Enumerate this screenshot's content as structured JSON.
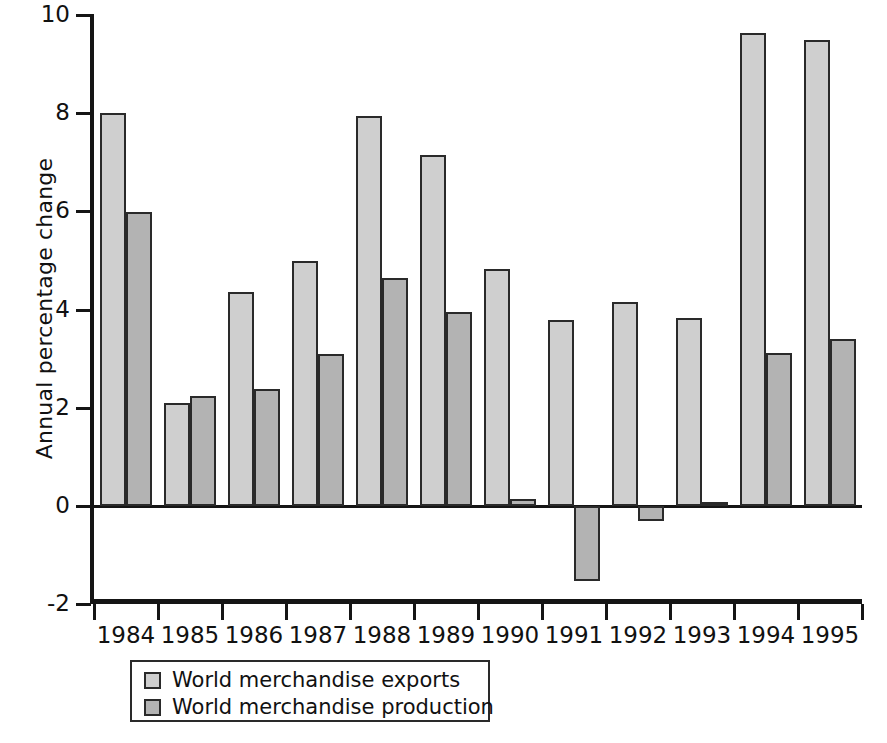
{
  "chart_data": {
    "type": "bar",
    "title": "",
    "xlabel": "",
    "ylabel": "Annual percentage change",
    "ylim": [
      -2,
      10
    ],
    "yticks": [
      10,
      8,
      6,
      4,
      2,
      0,
      -2
    ],
    "ytick_labels": [
      "10",
      "8",
      "6",
      "4",
      "2",
      "0",
      "-2"
    ],
    "grid": false,
    "legend_position": "below-axes",
    "categories": [
      "1984",
      "1985",
      "1986",
      "1987",
      "1988",
      "1989",
      "1990",
      "1991",
      "1992",
      "1993",
      "1994",
      "1995"
    ],
    "series": [
      {
        "name": "World merchandise exports",
        "color": "#cfcfcf",
        "values": [
          8.0,
          2.1,
          4.35,
          5.0,
          7.95,
          7.15,
          4.83,
          3.78,
          4.15,
          3.83,
          9.63,
          9.5
        ]
      },
      {
        "name": "World merchandise production",
        "color": "#b3b3b3",
        "values": [
          5.98,
          2.25,
          2.38,
          3.1,
          4.65,
          3.95,
          0.15,
          -1.53,
          -0.3,
          0.09,
          3.12,
          3.4
        ]
      }
    ]
  },
  "legend": {
    "items": [
      {
        "label": "World merchandise exports",
        "swatch": "exports"
      },
      {
        "label": "World merchandise production",
        "swatch": "production"
      }
    ]
  }
}
